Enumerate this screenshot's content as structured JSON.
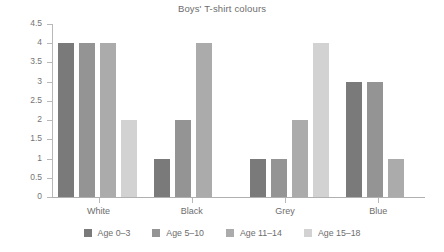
{
  "chart_data": {
    "type": "bar",
    "title": "Boys' T-shirt colours",
    "xlabel": "",
    "ylabel": "",
    "ylim": [
      0,
      4.5
    ],
    "ytick_step": 0.5,
    "yticks": [
      "4.5",
      "4",
      "3.5",
      "3",
      "2.5",
      "2",
      "1.5",
      "1",
      "0.5",
      "0"
    ],
    "ytick_values": [
      4.5,
      4,
      3.5,
      3,
      2.5,
      2,
      1.5,
      1,
      0.5,
      0
    ],
    "grid": false,
    "legend_position": "bottom",
    "categories": [
      "White",
      "Black",
      "Grey",
      "Blue"
    ],
    "series": [
      {
        "name": "Age 0–3",
        "color": "#7a7a7a",
        "values": [
          4,
          1,
          1,
          3
        ]
      },
      {
        "name": "Age 5–10",
        "color": "#949494",
        "values": [
          4,
          2,
          1,
          3
        ]
      },
      {
        "name": "Age 11–14",
        "color": "#ababab",
        "values": [
          4,
          4,
          2,
          1
        ]
      },
      {
        "name": "Age 15–18",
        "color": "#d2d2d2",
        "values": [
          2,
          0,
          4,
          0
        ]
      }
    ],
    "axis_color": "#b8b8b8",
    "text_color": "#6d6d6d"
  }
}
